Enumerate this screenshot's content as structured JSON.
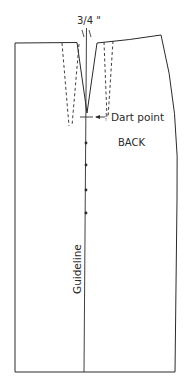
{
  "diagram": {
    "type": "sewing-pattern",
    "piece": "skirt back",
    "labels": {
      "dart_width": "3/4 \"",
      "dart_point": "Dart point",
      "piece_name": "BACK",
      "guideline": "Guideline"
    },
    "guideline_marks": 5,
    "colors": {
      "line": "#2a2a2a",
      "background": "#ffffff"
    }
  }
}
